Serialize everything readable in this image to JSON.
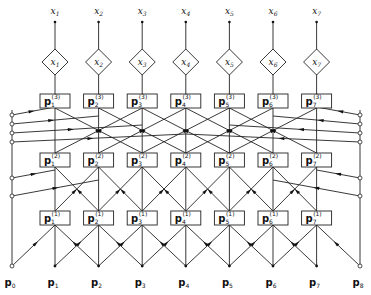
{
  "diagram": {
    "title": "",
    "type": "systolic lattice array",
    "columns": 7,
    "outputs": [
      {
        "label": "x",
        "sub": "1"
      },
      {
        "label": "x",
        "sub": "2"
      },
      {
        "label": "x",
        "sub": "3"
      },
      {
        "label": "x",
        "sub": "4"
      },
      {
        "label": "x",
        "sub": "5"
      },
      {
        "label": "x",
        "sub": "6"
      },
      {
        "label": "x",
        "sub": "7"
      }
    ],
    "diamonds": [
      {
        "label": "x",
        "sub": "1"
      },
      {
        "label": "x",
        "sub": "2"
      },
      {
        "label": "x",
        "sub": "3"
      },
      {
        "label": "x",
        "sub": "4"
      },
      {
        "label": "x",
        "sub": "5"
      },
      {
        "label": "x",
        "sub": "6"
      },
      {
        "label": "x",
        "sub": "7"
      }
    ],
    "stages": [
      {
        "stage": "3",
        "boxes": [
          "1",
          "2",
          "3",
          "4",
          "5",
          "6",
          "7"
        ],
        "label": "p"
      },
      {
        "stage": "2",
        "boxes": [
          "1",
          "2",
          "3",
          "4",
          "5",
          "6",
          "7"
        ],
        "label": "p"
      },
      {
        "stage": "1",
        "boxes": [
          "1",
          "2",
          "3",
          "4",
          "5",
          "6",
          "7"
        ],
        "label": "p"
      }
    ],
    "inputs": [
      {
        "label": "p",
        "sub": "0"
      },
      {
        "label": "p",
        "sub": "1"
      },
      {
        "label": "p",
        "sub": "2"
      },
      {
        "label": "p",
        "sub": "3"
      },
      {
        "label": "p",
        "sub": "4"
      },
      {
        "label": "p",
        "sub": "5"
      },
      {
        "label": "p",
        "sub": "6"
      },
      {
        "label": "p",
        "sub": "7"
      },
      {
        "label": "p",
        "sub": "8"
      }
    ]
  }
}
